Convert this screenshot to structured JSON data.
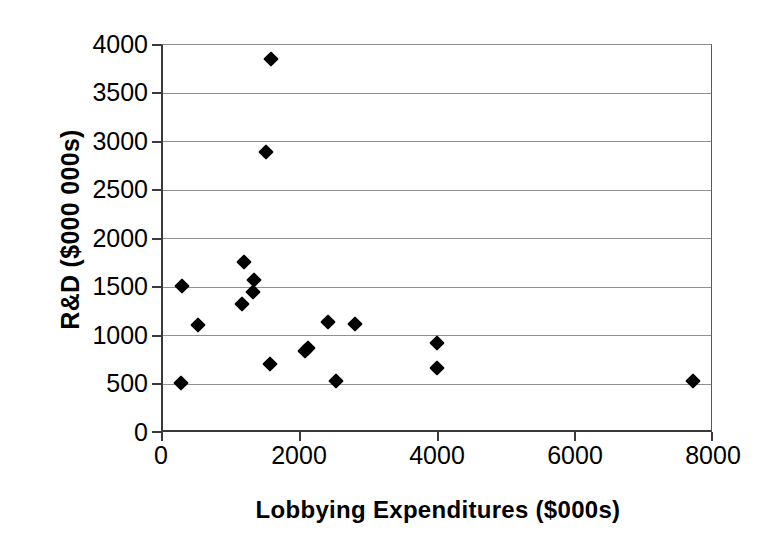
{
  "chart_data": {
    "type": "scatter",
    "title": "",
    "xlabel": "Lobbying Expenditures ($000s)",
    "ylabel": "R&D ($000 000s)",
    "xlim": [
      0,
      8000
    ],
    "ylim": [
      0,
      4000
    ],
    "xticks": [
      0,
      2000,
      4000,
      6000,
      8000
    ],
    "yticks": [
      0,
      500,
      1000,
      1500,
      2000,
      2500,
      3000,
      3500,
      4000
    ],
    "xtick_labels": [
      "0",
      "2000",
      "4000",
      "6000",
      "8000"
    ],
    "ytick_labels": [
      "0",
      "500",
      "1000",
      "1500",
      "2000",
      "2500",
      "3000",
      "3500",
      "4000"
    ],
    "grid": "horizontal",
    "legend": "none",
    "marker": "filled-diamond",
    "marker_color": "#000000",
    "points": [
      {
        "x": 1600,
        "y": 3850
      },
      {
        "x": 1520,
        "y": 2890
      },
      {
        "x": 1200,
        "y": 1750
      },
      {
        "x": 1350,
        "y": 1570
      },
      {
        "x": 1330,
        "y": 1440
      },
      {
        "x": 1180,
        "y": 1320
      },
      {
        "x": 300,
        "y": 1510
      },
      {
        "x": 530,
        "y": 1100
      },
      {
        "x": 2430,
        "y": 1135
      },
      {
        "x": 2810,
        "y": 1110
      },
      {
        "x": 4010,
        "y": 920
      },
      {
        "x": 2130,
        "y": 870
      },
      {
        "x": 2090,
        "y": 840
      },
      {
        "x": 1580,
        "y": 700
      },
      {
        "x": 4010,
        "y": 660
      },
      {
        "x": 2540,
        "y": 525
      },
      {
        "x": 290,
        "y": 510
      },
      {
        "x": 7720,
        "y": 525
      }
    ]
  }
}
